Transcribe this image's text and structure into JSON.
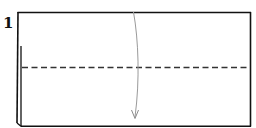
{
  "diagram": {
    "type": "origami-fold-step",
    "step_number": "1",
    "shapes": {
      "paper": "rectangle",
      "fold_line": "dashed-horizontal-center",
      "fold_arrow": "curved-down-arrow"
    },
    "colors": {
      "outline": "#111111",
      "fold_line": "#333333",
      "arrow": "#9a9a9a",
      "background": "#ffffff"
    }
  }
}
